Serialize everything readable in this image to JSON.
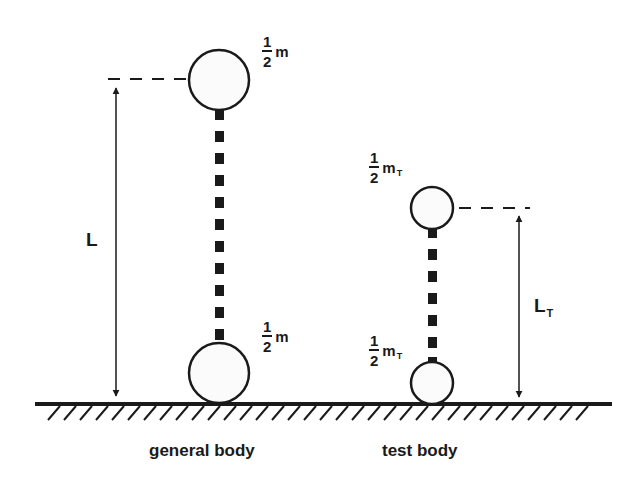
{
  "diagram": {
    "colors": {
      "ink": "#1a1a1a",
      "background": "#ffffff",
      "sphere_fill": "#fbfbfb"
    },
    "general_body": {
      "caption": "general body",
      "top_mass": {
        "numerator": "1",
        "denominator": "2",
        "symbol": "m",
        "subscript": ""
      },
      "bottom_mass": {
        "numerator": "1",
        "denominator": "2",
        "symbol": "m",
        "subscript": ""
      },
      "length_label": {
        "symbol": "L",
        "subscript": ""
      }
    },
    "test_body": {
      "caption": "test body",
      "top_mass": {
        "numerator": "1",
        "denominator": "2",
        "symbol": "m",
        "subscript": "T"
      },
      "bottom_mass": {
        "numerator": "1",
        "denominator": "2",
        "symbol": "m",
        "subscript": "T"
      },
      "length_label": {
        "symbol": "L",
        "subscript": "T"
      }
    }
  }
}
